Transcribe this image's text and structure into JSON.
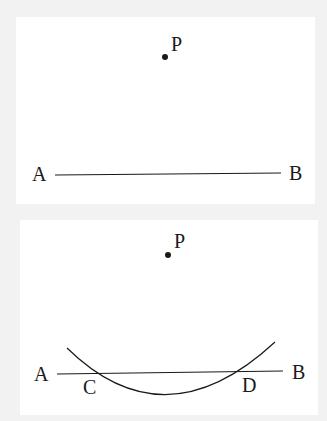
{
  "figures": {
    "top": {
      "point_label": "P",
      "line_start_label": "A",
      "line_end_label": "B"
    },
    "bottom": {
      "point_label": "P",
      "line_start_label": "A",
      "line_end_label": "B",
      "intersection_left_label": "C",
      "intersection_right_label": "D"
    }
  },
  "colors": {
    "background": "#f2f2f2",
    "panel": "#ffffff",
    "ink": "#1a1a1a"
  }
}
